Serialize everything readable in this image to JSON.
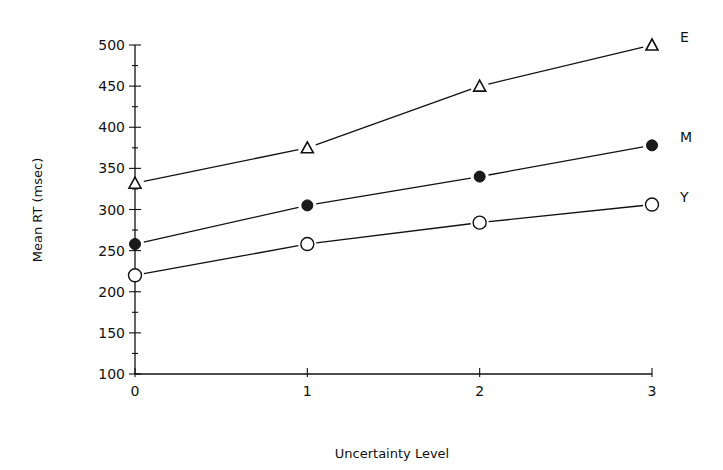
{
  "chart_data": {
    "type": "line",
    "title": "",
    "xlabel": "Uncertainty Level",
    "ylabel": "Mean RT (msec)",
    "x": [
      0,
      1,
      2,
      3
    ],
    "x_ticks": [
      "0",
      "1",
      "2",
      "3"
    ],
    "y_ticks": [
      100,
      150,
      200,
      250,
      300,
      350,
      400,
      450,
      500
    ],
    "ylim": [
      100,
      500
    ],
    "xlim": [
      0,
      3
    ],
    "grid": false,
    "legend_position": "right-end labels",
    "series": [
      {
        "name": "E",
        "marker": "open-triangle",
        "values": [
          332,
          375,
          450,
          500
        ]
      },
      {
        "name": "M",
        "marker": "filled-circle",
        "values": [
          258,
          305,
          340,
          378
        ]
      },
      {
        "name": "Y",
        "marker": "open-circle",
        "values": [
          220,
          258,
          284,
          306
        ]
      }
    ]
  },
  "layout": {
    "plot_left": 135,
    "plot_right": 652,
    "plot_top": 45,
    "plot_bottom": 374,
    "line_color": "#111111"
  }
}
